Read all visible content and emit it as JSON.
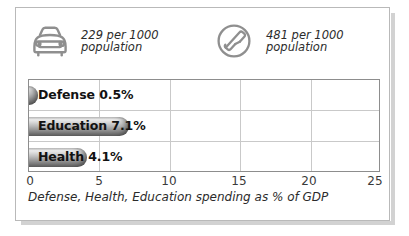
{
  "stats": [
    {
      "icon": "car-icon",
      "value": "229",
      "line1": "229 per 1000",
      "line2": "population"
    },
    {
      "icon": "telephone-icon",
      "value": "481",
      "line1": "481 per 1000",
      "line2": "population"
    }
  ],
  "chart_data": {
    "type": "bar",
    "orientation": "horizontal",
    "title": "",
    "categories": [
      "Defense",
      "Education",
      "Health"
    ],
    "values": [
      0.5,
      7.1,
      4.1
    ],
    "data_labels": [
      "Defense 0.5%",
      "Education 7.1%",
      "Health 4.1%"
    ],
    "xlabel": "Defense, Health, Education spending as % of GDP",
    "ylabel": "",
    "xlim": [
      0,
      25
    ],
    "xticks": [
      0,
      5,
      10,
      15,
      20,
      25
    ],
    "xtick_labels": [
      "0",
      "5",
      "10",
      "15",
      "20",
      "25"
    ],
    "grid": true,
    "legend": "none",
    "bar_color": "#8e8e8e",
    "grid_color": "#c9c9c9",
    "frame_color": "#8d8d8d"
  },
  "caption": "Defense, Health, Education spending as % of GDP"
}
